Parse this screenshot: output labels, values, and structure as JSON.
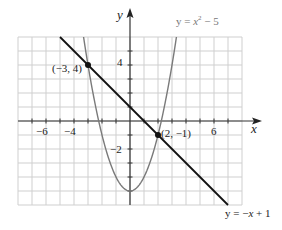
{
  "chart_data": {
    "type": "line",
    "title": "",
    "xlabel": "x",
    "ylabel": "y",
    "xlim": [
      -8,
      8
    ],
    "ylim": [
      -6,
      6
    ],
    "grid": true,
    "x_ticks_labeled": [
      -6,
      -4,
      6
    ],
    "y_ticks_labeled": [
      4,
      -2
    ],
    "tick_labels": {
      "x": [
        "−6",
        "−4",
        "6"
      ],
      "y": [
        "4",
        "−2"
      ]
    },
    "series": [
      {
        "name": "y = x² − 5",
        "type": "parabola",
        "equation": "y = x^2 - 5",
        "color": "#7a7a7a",
        "vertex": [
          0,
          -5
        ]
      },
      {
        "name": "y = −x + 1",
        "type": "line",
        "equation": "y = -x + 1",
        "color": "#111111",
        "x_range": [
          -5,
          7
        ]
      }
    ],
    "points": [
      {
        "x": -3,
        "y": 4,
        "label": "(−3, 4)"
      },
      {
        "x": 2,
        "y": -1,
        "label": "(2, −1)"
      }
    ],
    "annotations": {
      "parabola_label": "y = x² − 5",
      "line_label": "y = −x + 1"
    }
  },
  "labels": {
    "x_axis": "x",
    "y_axis": "y",
    "tick_neg6": "−6",
    "tick_neg4": "−4",
    "tick_6": "6",
    "tick_4": "4",
    "tick_neg2": "−2",
    "point1": "(−3, 4)",
    "point2": "(2, −1)",
    "parabola_eq_prefix": "y = ",
    "parabola_eq_x": "x",
    "parabola_eq_exp": "2",
    "parabola_eq_suffix": " − 5",
    "line_eq_prefix": "y = −",
    "line_eq_x": "x",
    "line_eq_suffix": " + 1"
  }
}
